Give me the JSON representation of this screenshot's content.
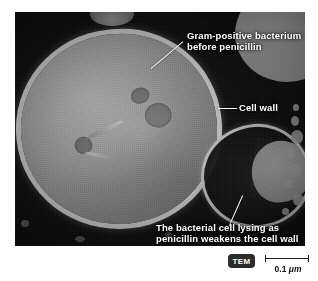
{
  "figure": {
    "kind": "electron-micrograph",
    "background_color": "#ffffff",
    "plate_color": "#050505"
  },
  "annotations": {
    "top": {
      "lines": [
        "Gram-positive",
        "bacterium",
        "before penicillin"
      ],
      "text": "Gram-positive bacterium before penicillin",
      "color": "#ffffff"
    },
    "cell_wall": {
      "text": "Cell wall",
      "color": "#ffffff"
    },
    "lysing": {
      "lines": [
        "The bacterial cell lysing as",
        "penicillin weakens the cell",
        "wall"
      ],
      "text": "The bacterial cell lysing as penicillin weakens the cell wall",
      "color": "#ffffff"
    }
  },
  "footer": {
    "technique_badge": "TEM",
    "badge_background": "#2b2b2b",
    "badge_text_color": "#ffffff",
    "scale_value": "0.1",
    "scale_unit": "μm",
    "scale_label": "0.1 μm",
    "scale_color": "#111111"
  },
  "specimen": {
    "main_cell_label": "gram-positive bacterium",
    "lysing_cell_label": "lysing bacterial cell"
  }
}
